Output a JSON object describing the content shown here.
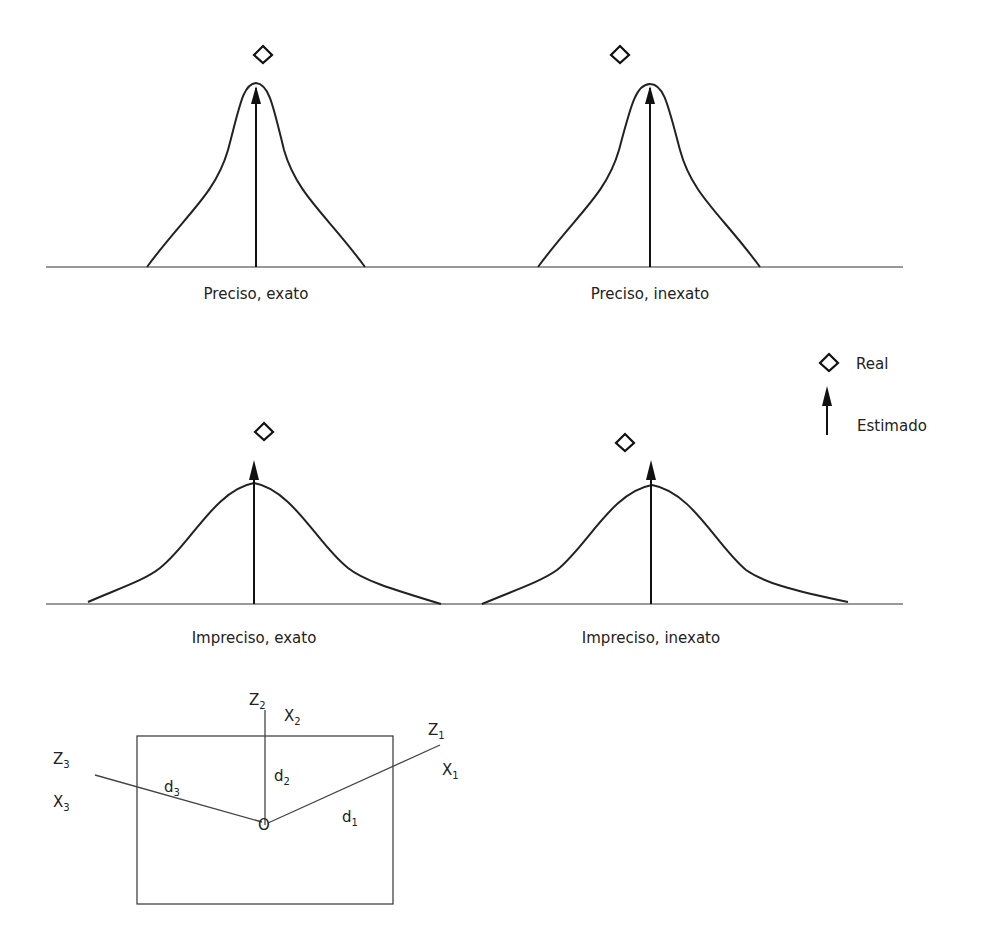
{
  "panels": [
    {
      "caption": "Preciso, exato",
      "precision": "high",
      "accuracy": "high"
    },
    {
      "caption": "Preciso, inexato",
      "precision": "high",
      "accuracy": "low"
    },
    {
      "caption": "Impreciso, exato",
      "precision": "low",
      "accuracy": "high"
    },
    {
      "caption": "Impreciso, inexato",
      "precision": "low",
      "accuracy": "low"
    }
  ],
  "legend": {
    "real": {
      "icon": "diamond-icon",
      "label": "Real"
    },
    "estimado": {
      "icon": "arrow-up-icon",
      "label": "Estimado"
    }
  },
  "geometry_diagram": {
    "origin_label": "O",
    "axes": [
      {
        "z": "Z",
        "z_sub": "1",
        "x": "X",
        "x_sub": "1",
        "d": "d",
        "d_sub": "1"
      },
      {
        "z": "Z",
        "z_sub": "2",
        "x": "X",
        "x_sub": "2",
        "d": "d",
        "d_sub": "2"
      },
      {
        "z": "Z",
        "z_sub": "3",
        "x": "X",
        "x_sub": "3",
        "d": "d",
        "d_sub": "3"
      }
    ]
  },
  "colors": {
    "line": "#222222",
    "baseline": "#777777",
    "background": "#ffffff"
  }
}
